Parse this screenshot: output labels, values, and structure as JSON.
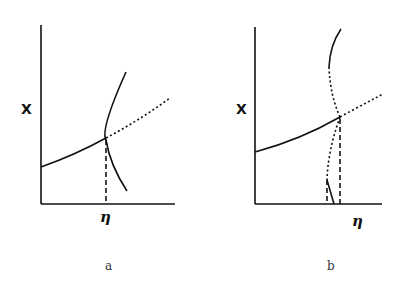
{
  "panels": [
    {
      "id": "a",
      "caption": "a",
      "y_label": "X",
      "x_label": "η"
    },
    {
      "id": "b",
      "caption": "b",
      "y_label": "X",
      "x_label": "η"
    }
  ],
  "colors": {
    "line": "#111111",
    "background": "#ffffff"
  }
}
